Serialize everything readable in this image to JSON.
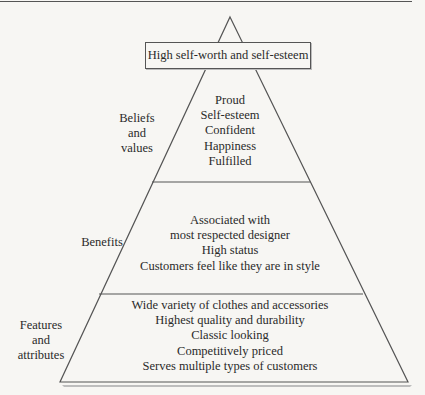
{
  "diagram": {
    "type": "pyramid",
    "apex_label": "High self-worth and self-esteem",
    "levels": [
      {
        "side_label": "Beliefs\nand\nvalues",
        "side_label_lines": [
          "Beliefs",
          "and",
          "values"
        ],
        "items": [
          "Proud",
          "Self-esteem",
          "Confident",
          "Happiness",
          "Fulfilled"
        ]
      },
      {
        "side_label": "Benefits",
        "side_label_lines": [
          "Benefits"
        ],
        "items": [
          "Associated with",
          "most respected designer",
          "High status",
          "Customers feel like they are in style"
        ]
      },
      {
        "side_label": "Features and attributes",
        "side_label_lines": [
          "Features",
          "and",
          "attributes"
        ],
        "items": [
          "Wide variety of clothes and accessories",
          "Highest quality and durability",
          "Classic looking",
          "Competitively priced",
          "Serves multiple types of customers"
        ]
      }
    ]
  },
  "colors": {
    "line": "#555555",
    "background": "#f7f6f3",
    "text": "#2a2a2a"
  }
}
